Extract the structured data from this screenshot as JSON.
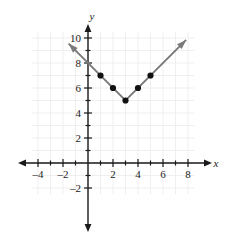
{
  "chart_data": {
    "type": "line",
    "title": "",
    "xlabel": "x",
    "ylabel": "y",
    "grid": true,
    "legend": "none",
    "xlim": [
      -4.5,
      8.5
    ],
    "ylim": [
      -2.5,
      10.5
    ],
    "x_ticks_major": [
      -4,
      -2,
      2,
      4,
      6,
      8
    ],
    "y_ticks_major": [
      -2,
      2,
      4,
      6,
      8,
      10
    ],
    "x_tick_labels": [
      "–4",
      "–2",
      "2",
      "4",
      "6",
      "8"
    ],
    "y_tick_labels": [
      "–2",
      "2",
      "4",
      "6",
      "8",
      "10"
    ],
    "x_ticks_minor": [
      -4,
      -3,
      -2,
      -1,
      1,
      2,
      3,
      4,
      5,
      6,
      7,
      8
    ],
    "y_ticks_minor": [
      -2,
      -1,
      1,
      2,
      3,
      4,
      5,
      6,
      7,
      8,
      9,
      10
    ],
    "function": "y = |x - 3| + 5",
    "vertex": [
      3,
      5
    ],
    "series": [
      {
        "name": "absolute value graph",
        "line_color": "#7a7a7a",
        "marker_color": "#111111",
        "arrow_both_ends": true,
        "line_endpoints": [
          [
            -1.55,
            9.55
          ],
          [
            7.85,
            9.85
          ]
        ],
        "points": [
          {
            "x": 1,
            "y": 7
          },
          {
            "x": 2,
            "y": 6
          },
          {
            "x": 3,
            "y": 5
          },
          {
            "x": 4,
            "y": 6
          },
          {
            "x": 5,
            "y": 7
          }
        ]
      }
    ],
    "colors": {
      "grid": "#f1eeee",
      "axis": "#1a1a1a",
      "curve": "#7a7a7a",
      "marker": "#111111",
      "background": "#ffffff"
    }
  }
}
